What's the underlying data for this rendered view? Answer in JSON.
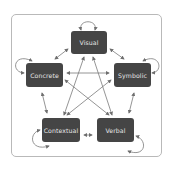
{
  "diagram": {
    "type": "node-link",
    "nodes": [
      {
        "id": "visual",
        "label": "Visual"
      },
      {
        "id": "concrete",
        "label": "Concrete"
      },
      {
        "id": "symbolic",
        "label": "Symbolic"
      },
      {
        "id": "contextual",
        "label": "Contextual"
      },
      {
        "id": "verbal",
        "label": "Verbal"
      }
    ],
    "edges": [
      {
        "from": "visual",
        "to": "concrete",
        "bidirectional": true
      },
      {
        "from": "visual",
        "to": "symbolic",
        "bidirectional": true
      },
      {
        "from": "concrete",
        "to": "contextual",
        "bidirectional": true
      },
      {
        "from": "symbolic",
        "to": "verbal",
        "bidirectional": true
      },
      {
        "from": "contextual",
        "to": "verbal",
        "bidirectional": true
      },
      {
        "from": "visual",
        "to": "contextual",
        "bidirectional": true
      },
      {
        "from": "visual",
        "to": "verbal",
        "bidirectional": true
      },
      {
        "from": "concrete",
        "to": "symbolic",
        "bidirectional": true
      },
      {
        "from": "concrete",
        "to": "verbal",
        "bidirectional": true
      },
      {
        "from": "symbolic",
        "to": "contextual",
        "bidirectional": true
      },
      {
        "from": "visual",
        "to": "visual",
        "self_loop": true
      },
      {
        "from": "concrete",
        "to": "concrete",
        "self_loop": true
      },
      {
        "from": "symbolic",
        "to": "symbolic",
        "self_loop": true
      },
      {
        "from": "contextual",
        "to": "contextual",
        "self_loop": true
      },
      {
        "from": "verbal",
        "to": "verbal",
        "self_loop": true
      }
    ],
    "colors": {
      "node_fill": "#454545",
      "node_text": "#e6e6e6",
      "arrow": "#7a7a7a",
      "frame": "#b9b9b9"
    }
  }
}
